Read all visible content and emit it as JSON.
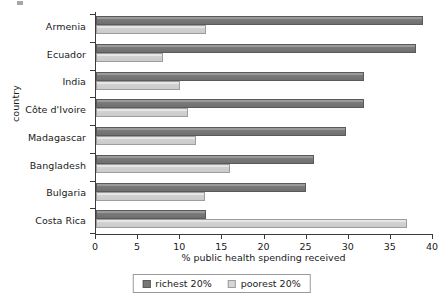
{
  "chart_data": {
    "type": "bar",
    "orientation": "horizontal",
    "title": "",
    "xlabel": "% public health spending received",
    "ylabel": "country",
    "xlim": [
      0,
      40
    ],
    "xticks": [
      0,
      5,
      10,
      15,
      20,
      25,
      30,
      35,
      40
    ],
    "grid": false,
    "legend_position": "bottom-center",
    "categories": [
      "Armenia",
      "Ecuador",
      "India",
      "Côte d'Ivoire",
      "Madagascar",
      "Bangladesh",
      "Bulgaria",
      "Costa Rica"
    ],
    "series": [
      {
        "name": "richest 20%",
        "color": "#787878",
        "values": [
          38.8,
          38.0,
          31.8,
          31.8,
          29.7,
          25.9,
          24.9,
          13.0
        ]
      },
      {
        "name": "poorest 20%",
        "color": "#d6d6d6",
        "values": [
          13.0,
          7.9,
          10.0,
          10.9,
          11.9,
          15.9,
          12.9,
          36.9
        ]
      }
    ]
  },
  "legend": {
    "items": [
      {
        "label": "richest 20%",
        "swatch": "richest"
      },
      {
        "label": "poorest 20%",
        "swatch": "poorest"
      }
    ]
  }
}
